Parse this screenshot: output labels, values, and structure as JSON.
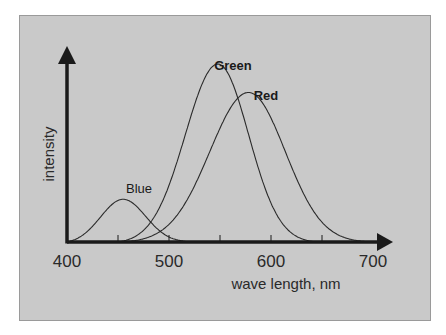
{
  "chart_data": {
    "type": "line",
    "title": "",
    "xlabel": "wave length, nm",
    "ylabel": "intensity",
    "xlim": [
      400,
      700
    ],
    "ylim": [
      0,
      1.05
    ],
    "x_ticks": [
      400,
      450,
      500,
      550,
      600,
      650,
      700
    ],
    "x_tick_labels": [
      "400",
      "500",
      "600",
      "700"
    ],
    "x_tick_label_values": [
      400,
      500,
      600,
      700
    ],
    "grid": false,
    "legend": "none",
    "series": [
      {
        "name": "Blue",
        "label": "Blue",
        "bold": false,
        "peak_nm": 455,
        "peak_value": 0.24,
        "start_nm": 400,
        "end_nm": 525,
        "width_left": 22,
        "width_right": 22
      },
      {
        "name": "Green",
        "label": "Green",
        "bold": true,
        "peak_nm": 548,
        "peak_value": 1.0,
        "start_nm": 450,
        "end_nm": 645,
        "width_left": 32,
        "width_right": 30
      },
      {
        "name": "Red",
        "label": "Red",
        "bold": true,
        "peak_nm": 578,
        "peak_value": 0.84,
        "start_nm": 452,
        "end_nm": 700,
        "width_left": 38,
        "width_right": 36
      }
    ],
    "colors": {
      "panel": "#c9c9c9",
      "ink": "#1a1a1a"
    }
  }
}
